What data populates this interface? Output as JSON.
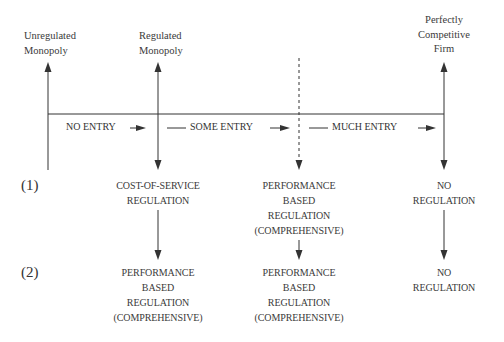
{
  "diagram": {
    "top_labels": {
      "unregulated": "Unregulated\nMonopoly",
      "regulated": "Regulated\nMonopoly",
      "competitive": "Perfectly\nCompetitive\nFirm"
    },
    "entry_labels": {
      "no_entry": "NO ENTRY",
      "some_entry": "SOME ENTRY",
      "much_entry": "MUCH ENTRY"
    },
    "row_labels": {
      "row1": "(1)",
      "row2": "(2)"
    },
    "row1": {
      "col1": "COST-OF-SERVICE\nREGULATION",
      "col2": "PERFORMANCE\nBASED\nREGULATION\n(COMPREHENSIVE)",
      "col3": "NO\nREGULATION"
    },
    "row2": {
      "col1": "PERFORMANCE\nBASED\nREGULATION\n(COMPREHENSIVE)",
      "col2": "PERFORMANCE\nBASED\nREGULATION\n(COMPREHENSIVE)",
      "col3": "NO\nREGULATION"
    },
    "colors": {
      "line": "#333333",
      "text": "#3a3a3a",
      "background": "#ffffff"
    }
  }
}
